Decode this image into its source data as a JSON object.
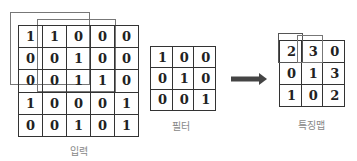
{
  "input": {
    "label": "입력",
    "rows": [
      [
        "1",
        "1",
        "0",
        "0",
        "0"
      ],
      [
        "0",
        "0",
        "1",
        "0",
        "0"
      ],
      [
        "0",
        "0",
        "1",
        "1",
        "0"
      ],
      [
        "1",
        "0",
        "0",
        "0",
        "1"
      ],
      [
        "0",
        "0",
        "1",
        "0",
        "1"
      ]
    ]
  },
  "filter": {
    "label": "필터",
    "rows": [
      [
        "1",
        "0",
        "0"
      ],
      [
        "0",
        "1",
        "0"
      ],
      [
        "0",
        "0",
        "1"
      ]
    ]
  },
  "feature_map": {
    "label": "특징맵",
    "rows": [
      [
        "2",
        "3",
        "0"
      ],
      [
        "0",
        "1",
        "3"
      ],
      [
        "1",
        "0",
        "2"
      ]
    ]
  },
  "arrow": {
    "direction": "right",
    "color": "#444444"
  }
}
